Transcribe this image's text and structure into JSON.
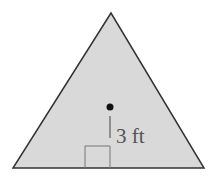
{
  "diagram": {
    "shape": "equilateral triangle",
    "fill_color": "#d9d9d9",
    "stroke_color": "#333333",
    "vertices": [
      [
        111,
        13
      ],
      [
        13,
        168
      ],
      [
        204,
        168
      ]
    ],
    "center_point": [
      110,
      107
    ],
    "apothem_label": "3 ft",
    "right_angle_marker": true
  }
}
